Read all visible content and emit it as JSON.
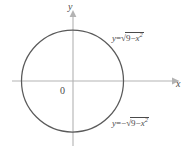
{
  "figure": {
    "background_color": "#ffffff",
    "axis_color": "#b3b3b3",
    "curve_color": "#5a5a5a",
    "text_color": "#4a4a4a"
  },
  "axes": {
    "x_label": "x",
    "y_label": "y",
    "origin_label": "0",
    "x_range": [
      -3.6,
      3.6
    ],
    "y_range": [
      -3.6,
      3.6
    ],
    "arrowheads": [
      "x-positive",
      "y-positive"
    ],
    "grid": false,
    "tick_labels": []
  },
  "curves": [
    {
      "name": "upper-semicircle",
      "equation_text": "y = √9 − x²",
      "parts": {
        "lhs": "y",
        "equals": "=",
        "radical_symbol": "√",
        "radicand_lead": "9",
        "minus": "−",
        "variable": "x",
        "exponent": "2",
        "sign_prefix": ""
      },
      "label_position": "upper-right"
    },
    {
      "name": "lower-semicircle",
      "equation_text": "y = −√9 − x²",
      "parts": {
        "lhs": "y",
        "equals": "=",
        "radical_symbol": "√",
        "radicand_lead": "9",
        "minus": "−",
        "variable": "x",
        "exponent": "2",
        "sign_prefix": "−"
      },
      "label_position": "lower-right"
    }
  ],
  "shape": {
    "type": "circle",
    "center": [
      0,
      0
    ],
    "radius": 3,
    "equation": "x² + y² = 9"
  }
}
